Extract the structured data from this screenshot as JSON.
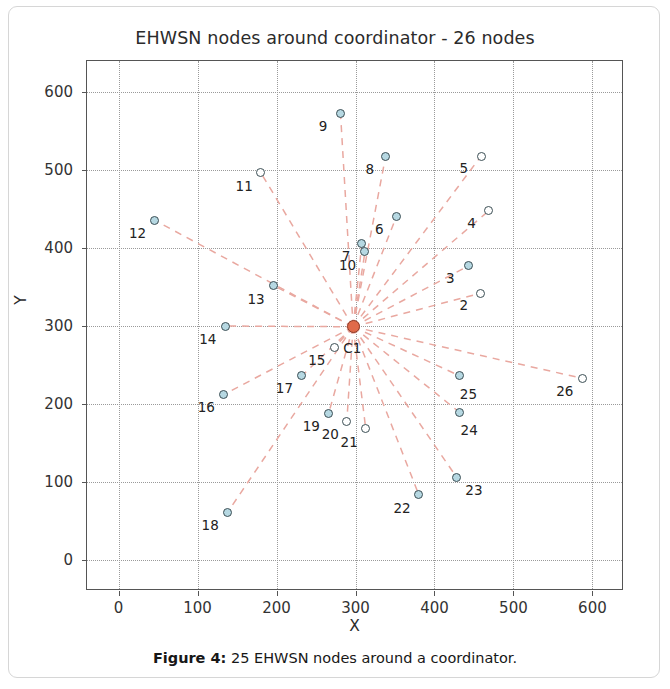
{
  "figure": {
    "title": "EHWSN nodes around coordinator - 26 nodes",
    "caption_bold": "Figure 4:",
    "caption_rest": " 25 EHWSN nodes around a coordinator."
  },
  "colors": {
    "node_fill": "#b6d8e2",
    "node_edge": "#3c4f55",
    "coordinator_fill": "#e06a4a",
    "link": "#e9a8a0",
    "grid": "#9a9a9a",
    "axis": "#555555"
  },
  "chart_data": {
    "type": "scatter",
    "title": "EHWSN nodes around coordinator - 26 nodes",
    "xlabel": "X",
    "ylabel": "Y",
    "xlim": [
      -40,
      640
    ],
    "ylim": [
      -40,
      640
    ],
    "xticks": [
      0,
      100,
      200,
      300,
      400,
      500,
      600
    ],
    "yticks": [
      0,
      100,
      200,
      300,
      400,
      500,
      600
    ],
    "grid": true,
    "legend": null,
    "coordinator": {
      "label": "C1",
      "x": 297,
      "y": 299,
      "lx": 296,
      "ly": 272
    },
    "points": [
      {
        "label": "2",
        "x": 458,
        "y": 342,
        "fill": "hollow",
        "lx": 437,
        "ly": 327
      },
      {
        "label": "3",
        "x": 443,
        "y": 377,
        "fill": "filled",
        "lx": 420,
        "ly": 362
      },
      {
        "label": "4",
        "x": 469,
        "y": 448,
        "fill": "hollow",
        "lx": 447,
        "ly": 432
      },
      {
        "label": "5",
        "x": 459,
        "y": 518,
        "fill": "hollow",
        "lx": 437,
        "ly": 503
      },
      {
        "label": "6",
        "x": 352,
        "y": 441,
        "fill": "filled",
        "lx": 330,
        "ly": 425
      },
      {
        "label": "7",
        "x": 308,
        "y": 406,
        "fill": "filled",
        "lx": 288,
        "ly": 390
      },
      {
        "label": "8",
        "x": 338,
        "y": 517,
        "fill": "filled",
        "lx": 318,
        "ly": 501
      },
      {
        "label": "9",
        "x": 281,
        "y": 573,
        "fill": "filled",
        "lx": 259,
        "ly": 557
      },
      {
        "label": "10",
        "x": 312,
        "y": 395,
        "fill": "filled",
        "lx": 290,
        "ly": 378
      },
      {
        "label": "11",
        "x": 180,
        "y": 497,
        "fill": "hollow",
        "lx": 159,
        "ly": 480
      },
      {
        "label": "12",
        "x": 45,
        "y": 436,
        "fill": "filled",
        "lx": 24,
        "ly": 419
      },
      {
        "label": "13",
        "x": 196,
        "y": 352,
        "fill": "filled",
        "lx": 174,
        "ly": 335
      },
      {
        "label": "14",
        "x": 135,
        "y": 300,
        "fill": "filled",
        "lx": 113,
        "ly": 283
      },
      {
        "label": "15",
        "x": 273,
        "y": 272,
        "fill": "hollow",
        "lx": 251,
        "ly": 256
      },
      {
        "label": "16",
        "x": 133,
        "y": 212,
        "fill": "filled",
        "lx": 111,
        "ly": 196
      },
      {
        "label": "17",
        "x": 232,
        "y": 236,
        "fill": "filled",
        "lx": 210,
        "ly": 220
      },
      {
        "label": "18",
        "x": 138,
        "y": 61,
        "fill": "filled",
        "lx": 116,
        "ly": 45
      },
      {
        "label": "19",
        "x": 266,
        "y": 188,
        "fill": "filled",
        "lx": 244,
        "ly": 172
      },
      {
        "label": "20",
        "x": 289,
        "y": 178,
        "fill": "hollow",
        "lx": 268,
        "ly": 161
      },
      {
        "label": "21",
        "x": 313,
        "y": 168,
        "fill": "hollow",
        "lx": 292,
        "ly": 151
      },
      {
        "label": "22",
        "x": 380,
        "y": 84,
        "fill": "filled",
        "lx": 359,
        "ly": 67
      },
      {
        "label": "23",
        "x": 428,
        "y": 106,
        "fill": "filled",
        "lx": 450,
        "ly": 90
      },
      {
        "label": "24",
        "x": 432,
        "y": 189,
        "fill": "filled",
        "lx": 444,
        "ly": 166
      },
      {
        "label": "25",
        "x": 432,
        "y": 236,
        "fill": "filled",
        "lx": 443,
        "ly": 213
      },
      {
        "label": "26",
        "x": 587,
        "y": 233,
        "fill": "hollow",
        "lx": 565,
        "ly": 216
      }
    ]
  }
}
